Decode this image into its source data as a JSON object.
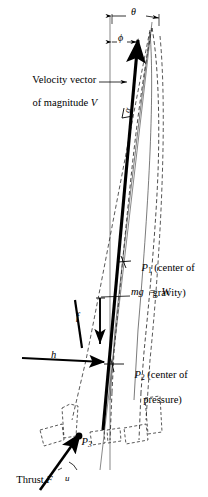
{
  "figure": {
    "background_color": "#ffffff",
    "ink_color": "#000000",
    "labels": {
      "theta": "θ",
      "phi": "ϕ",
      "alpha": "α",
      "velocity_line1": "Velocity vector",
      "velocity_line2": "of magnitude ",
      "velocity_symbol": "V",
      "p1_symbol": "P",
      "p1_subscript": "1",
      "p1_text": " (center of",
      "p1_text2": "gravity)",
      "weight": "mg  =  W",
      "p2_symbol": "P",
      "p2_subscript": "2",
      "p2_text": " (center of",
      "p2_text2": "pressure)",
      "h": "h",
      "f": "f",
      "p3_symbol": "P",
      "p3_subscript": "3",
      "thrust_text": "Thrust ",
      "thrust_symbol": "F",
      "u": "u"
    },
    "annotations": {
      "theta_description": "Angle between vertical reference and body axis",
      "phi_description": "Angle between vertical reference and velocity vector",
      "alpha_description": "Angle of attack between velocity vector and body axis",
      "p1_description": "Center of gravity",
      "p2_description": "Center of pressure",
      "p3_description": "Thrust application point",
      "h_description": "Aerodynamic normal force at center of pressure",
      "f_description": "Aerodynamic force magnitude",
      "u_description": "Thrust deflection angle"
    }
  }
}
